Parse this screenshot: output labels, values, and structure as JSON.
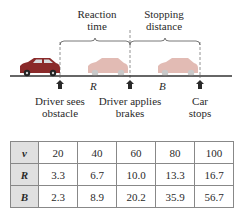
{
  "diagram": {
    "labels": {
      "reaction_time": [
        "Reaction",
        "time"
      ],
      "stopping_distance": [
        "Stopping",
        "distance"
      ],
      "R": "R",
      "B": "B",
      "driver_sees": [
        "Driver sees",
        "obstacle"
      ],
      "driver_applies": [
        "Driver applies",
        "brakes"
      ],
      "car_stops": [
        "Car",
        "stops"
      ]
    },
    "colors": {
      "car_main": "#8a2a2a",
      "car_ghost": "#e2b8b0",
      "arrow": "#2a2a2a",
      "road": "#333333"
    }
  },
  "table": {
    "rows": [
      {
        "header": "v",
        "values": [
          "20",
          "40",
          "60",
          "80",
          "100"
        ]
      },
      {
        "header": "R",
        "values": [
          "3.3",
          "6.7",
          "10.0",
          "13.3",
          "16.7"
        ]
      },
      {
        "header": "B",
        "values": [
          "2.3",
          "8.9",
          "20.2",
          "35.9",
          "56.7"
        ]
      }
    ]
  }
}
